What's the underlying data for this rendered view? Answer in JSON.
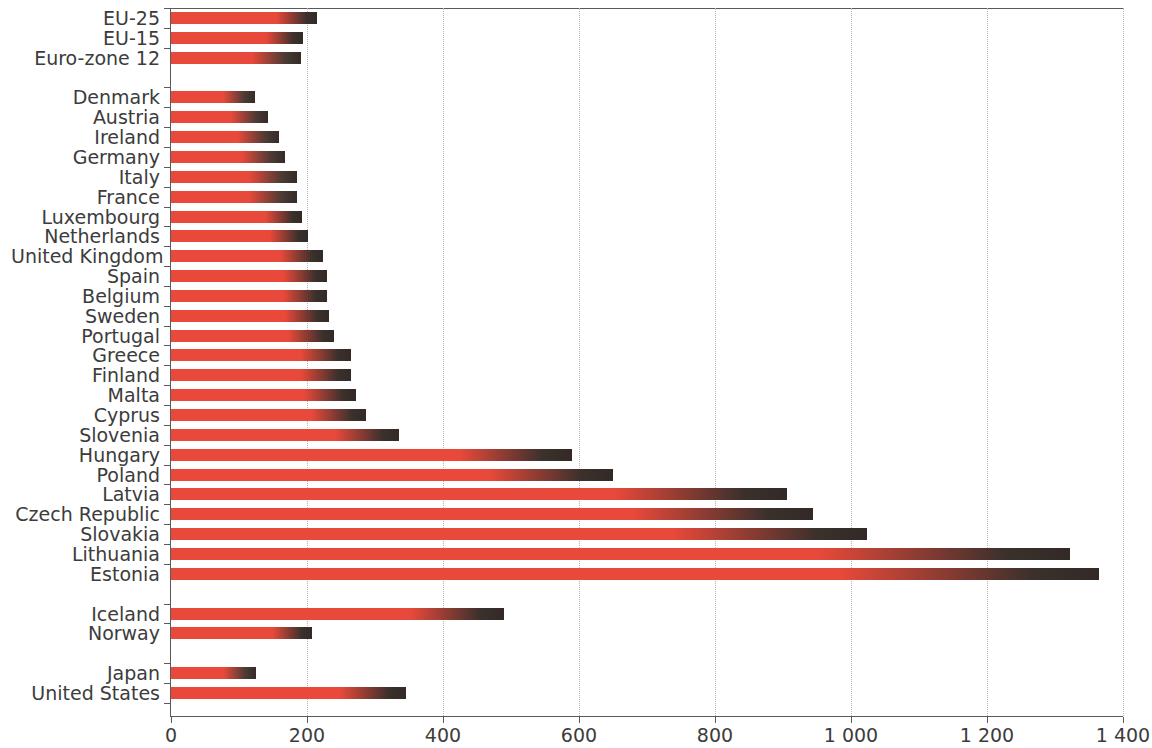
{
  "chart_data": {
    "type": "bar",
    "orientation": "horizontal",
    "title": "",
    "subtitle": "",
    "xlabel": "",
    "ylabel": "",
    "xlim": [
      0,
      1400
    ],
    "xticks": [
      0,
      200,
      400,
      600,
      800,
      1000,
      1200,
      1400
    ],
    "xtick_labels": [
      "0",
      "200",
      "400",
      "600",
      "800",
      "1 000",
      "1 200",
      "1 400"
    ],
    "grid": "vertical-dotted",
    "legend": "none",
    "bar_color": "#e8493a",
    "bar_tip_color": "#332a26",
    "groups": [
      {
        "name": "aggregates",
        "categories": [
          "EU-25",
          "EU-15",
          "Euro-zone 12"
        ],
        "values": [
          214,
          194,
          191
        ]
      },
      {
        "name": "member-states",
        "categories": [
          "Denmark",
          "Austria",
          "Ireland",
          "Germany",
          "Italy",
          "France",
          "Luxembourg",
          "Netherlands",
          "United Kingdom",
          "Spain",
          "Belgium",
          "Sweden",
          "Portugal",
          "Greece",
          "Finland",
          "Malta",
          "Cyprus",
          "Slovenia",
          "Hungary",
          "Poland",
          "Latvia",
          "Czech Republic",
          "Slovakia",
          "Lithuania",
          "Estonia"
        ],
        "values": [
          124,
          143,
          159,
          167,
          186,
          186,
          192,
          201,
          223,
          230,
          230,
          232,
          239,
          264,
          265,
          272,
          287,
          336,
          590,
          650,
          906,
          944,
          1024,
          1322,
          1365
        ]
      },
      {
        "name": "efta",
        "categories": [
          "Iceland",
          "Norway"
        ],
        "values": [
          490,
          208
        ]
      },
      {
        "name": "non-european",
        "categories": [
          "Japan",
          "United States"
        ],
        "values": [
          125,
          345
        ]
      }
    ],
    "categories": [
      "EU-25",
      "EU-15",
      "Euro-zone 12",
      "Denmark",
      "Austria",
      "Ireland",
      "Germany",
      "Italy",
      "France",
      "Luxembourg",
      "Netherlands",
      "United Kingdom",
      "Spain",
      "Belgium",
      "Sweden",
      "Portugal",
      "Greece",
      "Finland",
      "Malta",
      "Cyprus",
      "Slovenia",
      "Hungary",
      "Poland",
      "Latvia",
      "Czech Republic",
      "Slovakia",
      "Lithuania",
      "Estonia",
      "Iceland",
      "Norway",
      "Japan",
      "United States"
    ],
    "values": [
      214,
      194,
      191,
      124,
      143,
      159,
      167,
      186,
      186,
      192,
      201,
      223,
      230,
      230,
      232,
      239,
      264,
      265,
      272,
      287,
      336,
      590,
      650,
      906,
      944,
      1024,
      1322,
      1365,
      490,
      208,
      125,
      345
    ]
  }
}
